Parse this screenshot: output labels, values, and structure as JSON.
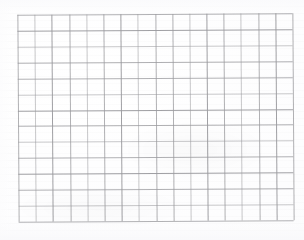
{
  "document": {
    "type": "scanned-grid-paper",
    "title": "Blank grid paper scan",
    "paper_color": "#fdfdfd",
    "line_color": "#9b9b9f",
    "has_text": false,
    "text_content": "",
    "annotations": []
  },
  "grid": {
    "columns": 16,
    "rows": 13,
    "cell_width_px": 17.2,
    "cell_height_px": 15.9,
    "origin_x_px": 18,
    "origin_y_px": 14,
    "width_px": 275,
    "height_px": 207,
    "rotation_deg": -0.35,
    "line_weights": [
      "mid",
      "light",
      "dark",
      "mid",
      "light",
      "mid",
      "dark",
      "light",
      "mid",
      "mid",
      "light",
      "dark",
      "mid",
      "light",
      "mid",
      "dark",
      "mid"
    ],
    "row_line_weights": [
      "mid",
      "dark",
      "light",
      "mid",
      "mid",
      "light",
      "dark",
      "mid",
      "light",
      "mid",
      "dark",
      "mid",
      "light",
      "mid"
    ]
  },
  "chart_data": {
    "type": "table",
    "xlabel": "",
    "ylabel": "",
    "categories": [],
    "values": [],
    "note": "Empty 16 x 13 ruled grid; no plotted data, labels, or tick values present."
  }
}
